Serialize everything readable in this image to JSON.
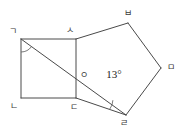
{
  "figure": {
    "type": "geometry-diagram",
    "background_color": "#ffffff",
    "line_color": "#4a4a4a",
    "arc_color": "#6a6a6a",
    "label_color": "#3a3a3a",
    "angle_label_color": "#222222",
    "vertices": [
      {
        "id": "g",
        "label": "ㄱ",
        "x": 21,
        "y": 39,
        "label_x": 13,
        "label_y": 32
      },
      {
        "id": "n",
        "label": "ㄴ",
        "x": 21,
        "y": 98,
        "label_x": 14,
        "label_y": 107
      },
      {
        "id": "d",
        "label": "ㄷ",
        "x": 76,
        "y": 98,
        "label_x": 74,
        "label_y": 108
      },
      {
        "id": "s",
        "label": "ㅅ",
        "x": 76,
        "y": 39,
        "label_x": 70,
        "label_y": 31
      },
      {
        "id": "b",
        "label": "ㅂ",
        "x": 128,
        "y": 23,
        "label_x": 128,
        "label_y": 14
      },
      {
        "id": "m",
        "label": "ㅁ",
        "x": 161,
        "y": 68,
        "label_x": 171,
        "label_y": 68
      },
      {
        "id": "r",
        "label": "ㄹ",
        "x": 126,
        "y": 115,
        "label_x": 124,
        "label_y": 124
      },
      {
        "id": "o",
        "label": "ㅇ",
        "x": 76,
        "y": 75,
        "label_x": 84,
        "label_y": 76
      }
    ],
    "edges": [
      {
        "name": "edge-g-n",
        "from": "g",
        "to": "n"
      },
      {
        "name": "edge-n-d",
        "from": "n",
        "to": "d"
      },
      {
        "name": "edge-d-s",
        "from": "d",
        "to": "s"
      },
      {
        "name": "edge-s-g",
        "from": "s",
        "to": "g"
      },
      {
        "name": "edge-s-b",
        "from": "s",
        "to": "b"
      },
      {
        "name": "edge-b-m",
        "from": "b",
        "to": "m"
      },
      {
        "name": "edge-m-r",
        "from": "m",
        "to": "r"
      },
      {
        "name": "edge-r-d",
        "from": "r",
        "to": "d"
      },
      {
        "name": "diagonal-g-r",
        "from": "g",
        "to": "r"
      }
    ],
    "angle_marks": [
      {
        "name": "angle-arc-at-g",
        "vertex": "g",
        "radius": 13
      },
      {
        "name": "angle-arc-at-r",
        "vertex": "r",
        "radius": 17
      }
    ],
    "angle_label": {
      "name": "angle-13-degrees",
      "text": "13°",
      "value": 13,
      "unit": "degrees",
      "x": 114,
      "y": 75
    }
  }
}
